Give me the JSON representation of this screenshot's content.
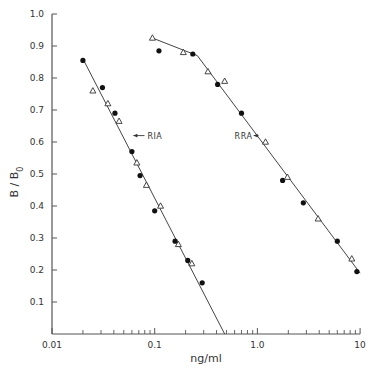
{
  "chart_data": {
    "type": "scatter",
    "title": "",
    "xlabel": "ng/ml",
    "ylabel": "B / B0",
    "xscale": "log",
    "xlim": [
      0.01,
      10
    ],
    "ylim": [
      0,
      1.0
    ],
    "grid": false,
    "x_ticks": [
      {
        "value": 0.01,
        "label": "0.01"
      },
      {
        "value": 0.1,
        "label": "0.1"
      },
      {
        "value": 1.0,
        "label": "1.0"
      },
      {
        "value": 10,
        "label": "10"
      }
    ],
    "y_ticks": [
      {
        "value": 0.1,
        "label": "0.1"
      },
      {
        "value": 0.2,
        "label": "0.2"
      },
      {
        "value": 0.3,
        "label": "0.3"
      },
      {
        "value": 0.4,
        "label": "0.4"
      },
      {
        "value": 0.5,
        "label": "0.5"
      },
      {
        "value": 0.6,
        "label": "0.6"
      },
      {
        "value": 0.7,
        "label": "0.7"
      },
      {
        "value": 0.8,
        "label": "0.8"
      },
      {
        "value": 0.9,
        "label": "0.9"
      },
      {
        "value": 1.0,
        "label": "1.0"
      }
    ],
    "annotations": [
      {
        "text": "RIA",
        "x": 0.085,
        "y": 0.62,
        "arrow_to": [
          0.062,
          0.62
        ]
      },
      {
        "text": "RRA",
        "x": 0.6,
        "y": 0.62,
        "arrow_to": [
          0.92,
          0.62
        ]
      }
    ],
    "series": [
      {
        "name": "RIA",
        "line": [
          [
            0.02,
            0.86
          ],
          [
            0.48,
            0.0
          ]
        ],
        "filled_circles": [
          [
            0.02,
            0.855
          ],
          [
            0.031,
            0.77
          ],
          [
            0.041,
            0.69
          ],
          [
            0.06,
            0.57
          ],
          [
            0.072,
            0.495
          ],
          [
            0.1,
            0.385
          ],
          [
            0.158,
            0.29
          ],
          [
            0.21,
            0.23
          ],
          [
            0.29,
            0.16
          ]
        ],
        "open_triangles": [
          [
            0.025,
            0.76
          ],
          [
            0.035,
            0.72
          ],
          [
            0.045,
            0.665
          ],
          [
            0.067,
            0.535
          ],
          [
            0.083,
            0.465
          ],
          [
            0.114,
            0.4
          ],
          [
            0.17,
            0.28
          ],
          [
            0.23,
            0.22
          ]
        ]
      },
      {
        "name": "RRA",
        "line": [
          [
            0.095,
            0.925
          ],
          [
            0.26,
            0.87
          ],
          [
            10,
            0.19
          ]
        ],
        "filled_circles": [
          [
            0.11,
            0.885
          ],
          [
            0.235,
            0.875
          ],
          [
            0.41,
            0.78
          ],
          [
            0.7,
            0.69
          ],
          [
            1.76,
            0.48
          ],
          [
            2.8,
            0.41
          ],
          [
            6.0,
            0.29
          ],
          [
            9.3,
            0.195
          ]
        ],
        "open_triangles": [
          [
            0.095,
            0.925
          ],
          [
            0.19,
            0.88
          ],
          [
            0.33,
            0.82
          ],
          [
            0.48,
            0.79
          ],
          [
            1.2,
            0.6
          ],
          [
            1.96,
            0.49
          ],
          [
            3.9,
            0.36
          ],
          [
            8.3,
            0.235
          ]
        ]
      }
    ]
  }
}
